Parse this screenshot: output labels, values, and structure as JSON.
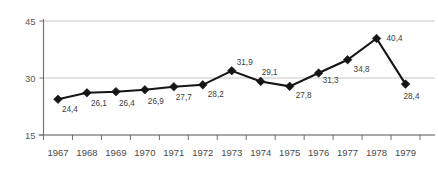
{
  "chart_data": {
    "type": "line",
    "title": "",
    "subtitle": "",
    "xlabel": "",
    "ylabel": "",
    "categories": [
      "1967",
      "1968",
      "1969",
      "1970",
      "1971",
      "1972",
      "1973",
      "1974",
      "1975",
      "1976",
      "1977",
      "1978",
      "1979"
    ],
    "values": [
      24.4,
      26.1,
      26.4,
      26.9,
      27.7,
      28.2,
      31.9,
      29.1,
      27.8,
      31.3,
      34.8,
      40.4,
      28.4
    ],
    "point_labels": [
      "24,4",
      "26,1",
      "26,4",
      "26,9",
      "27,7",
      "28,2",
      "31,9",
      "29,1",
      "27,8",
      "31,3",
      "34,8",
      "40,4",
      "28,4"
    ],
    "ylim": [
      15,
      45
    ],
    "yticks": [
      15,
      30,
      45
    ],
    "ytick_labels": [
      "15",
      "30",
      "45"
    ],
    "grid": true,
    "legend": "none",
    "decimal_separator": ",",
    "marker": "diamond",
    "series_color": "#151515",
    "grid_color": "#b9b9b9",
    "axis_color": "#6e6e6e"
  },
  "label_offsets": [
    {
      "dx": 4,
      "dy": 13
    },
    {
      "dx": 4,
      "dy": 13
    },
    {
      "dx": 3,
      "dy": 14
    },
    {
      "dx": 3,
      "dy": 14
    },
    {
      "dx": 2,
      "dy": 13
    },
    {
      "dx": 5,
      "dy": 12
    },
    {
      "dx": 5,
      "dy": -6
    },
    {
      "dx": 1,
      "dy": -6
    },
    {
      "dx": 6,
      "dy": 12
    },
    {
      "dx": 4,
      "dy": 10
    },
    {
      "dx": 6,
      "dy": 12
    },
    {
      "dx": 10,
      "dy": 3
    },
    {
      "dx": -2,
      "dy": 15
    }
  ]
}
